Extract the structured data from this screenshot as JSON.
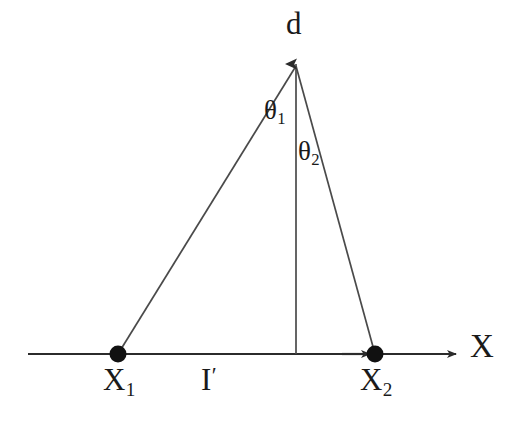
{
  "figure": {
    "type": "geometry-diagram",
    "background_color": "#ffffff",
    "stroke_color": "#2b2b2b",
    "text_color": "#1a1a1a",
    "width": 511,
    "height": 428
  },
  "labels": {
    "apex": "d",
    "angle_1_symbol": "θ",
    "angle_1_subscript": "1",
    "angle_2_symbol": "θ",
    "angle_2_subscript": "2",
    "point_1_symbol": "X",
    "point_1_subscript": "1",
    "point_2_symbol": "X",
    "point_2_subscript": "2",
    "baseline_symbol": "I",
    "baseline_prime": "′",
    "axis": "X"
  },
  "geometry": {
    "apex": {
      "x": 296,
      "y": 58
    },
    "point_1": {
      "x": 118,
      "y": 354
    },
    "point_2": {
      "x": 375,
      "y": 354
    },
    "axis_start": {
      "x": 28,
      "y": 354
    },
    "axis_end": {
      "x": 462,
      "y": 354
    },
    "vertical_base": {
      "x": 296,
      "y": 354
    },
    "dot_radius": 8
  }
}
